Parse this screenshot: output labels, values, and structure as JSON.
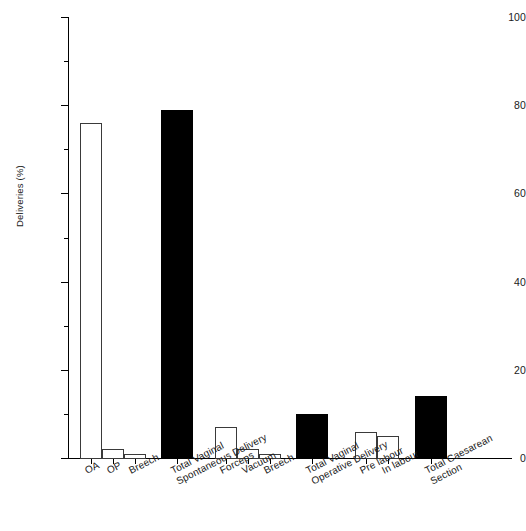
{
  "chart_data": {
    "type": "bar",
    "title": "",
    "subtitle": "",
    "xlabel": "",
    "ylabel": "Deliveries (%)",
    "ylim": [
      0,
      100
    ],
    "ytick_step": 20,
    "yminor_step": 10,
    "grid": false,
    "legend": "none",
    "categories": [
      "OA",
      "OP",
      "Breech",
      "Total Vaginal Spontaneous Delivery",
      "Forceps",
      "Vacuum",
      "Breech",
      "Total Vaginal Operative Delivery",
      "Pre labour",
      "In labour",
      "Total Caesarean Section"
    ],
    "values": [
      76,
      2,
      1,
      79,
      7,
      2,
      1,
      10,
      6,
      5,
      14
    ],
    "bar_styles": [
      "open",
      "open",
      "open",
      "filled",
      "open",
      "open",
      "open",
      "filled",
      "open",
      "open",
      "filled"
    ],
    "ytick_labels": [
      "0",
      "20",
      "40",
      "60",
      "80",
      "100"
    ],
    "ytick_values": [
      0,
      20,
      40,
      60,
      80,
      100
    ],
    "yminor_values": [
      10,
      30,
      50,
      70,
      90
    ],
    "colors": {
      "open_fill": "#ffffff",
      "open_stroke": "#3a3a3a",
      "filled": "#000000",
      "axis": "#000000",
      "text": "#1a1a1a",
      "background": "#ffffff"
    }
  },
  "bars": [
    {
      "label": "OA",
      "label2": "",
      "value": 76,
      "style": "open",
      "x": 80,
      "w": 22
    },
    {
      "label": "OP",
      "label2": "",
      "value": 2,
      "style": "open",
      "x": 102,
      "w": 22
    },
    {
      "label": "Breech",
      "label2": "",
      "value": 1,
      "style": "open",
      "x": 124,
      "w": 22
    },
    {
      "label": "Total Vaginal",
      "label2": "Spontaneous Delivery",
      "value": 79,
      "style": "filled",
      "x": 161,
      "w": 32
    },
    {
      "label": "Forceps",
      "label2": "",
      "value": 7,
      "style": "open",
      "x": 215,
      "w": 22
    },
    {
      "label": "Vacuum",
      "label2": "",
      "value": 2,
      "style": "open",
      "x": 237,
      "w": 22
    },
    {
      "label": "Breech",
      "label2": "",
      "value": 1,
      "style": "open",
      "x": 259,
      "w": 22
    },
    {
      "label": "Total Vaginal",
      "label2": "Operative Delivery",
      "value": 10,
      "style": "filled",
      "x": 296,
      "w": 32
    },
    {
      "label": "Pre labour",
      "label2": "",
      "value": 6,
      "style": "open",
      "x": 355,
      "w": 22
    },
    {
      "label": "In labour",
      "label2": "",
      "value": 5,
      "style": "open",
      "x": 377,
      "w": 22
    },
    {
      "label": "Total Caesarean",
      "label2": "Section",
      "value": 14,
      "style": "filled",
      "x": 415,
      "w": 32
    }
  ]
}
